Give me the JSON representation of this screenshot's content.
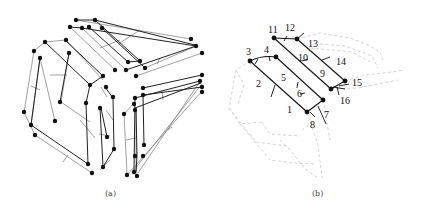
{
  "figure": {
    "panels": [
      {
        "id": "a",
        "caption": "(a)",
        "description": "Three-dimensional wireframe graph with nodes (black dots) arranged as three folded ladder/strip structures forming a cube-like corner view"
      },
      {
        "id": "b",
        "caption": "(b)",
        "description": "Highlighted sub-structure with two parallel solid strips and numbered edges 1-16; remaining structure dashed grey"
      }
    ],
    "panel_b_labels": [
      {
        "text": "1",
        "x": 287,
        "y": 113
      },
      {
        "text": "2",
        "x": 258,
        "y": 87
      },
      {
        "text": "3",
        "x": 248,
        "y": 54
      },
      {
        "text": "4",
        "x": 265,
        "y": 54
      },
      {
        "text": "5",
        "x": 282,
        "y": 80
      },
      {
        "text": "6",
        "x": 298,
        "y": 97
      },
      {
        "text": "7",
        "x": 325,
        "y": 116
      },
      {
        "text": "8",
        "x": 311,
        "y": 128
      },
      {
        "text": "9",
        "x": 320,
        "y": 76
      },
      {
        "text": "10",
        "x": 300,
        "y": 58
      },
      {
        "text": "11",
        "x": 268,
        "y": 32
      },
      {
        "text": "12",
        "x": 285,
        "y": 30
      },
      {
        "text": "13",
        "x": 309,
        "y": 47
      },
      {
        "text": "14",
        "x": 338,
        "y": 64
      },
      {
        "text": "15",
        "x": 352,
        "y": 85
      },
      {
        "text": "16",
        "x": 341,
        "y": 104
      }
    ],
    "colors": {
      "node": "#111111",
      "edge_dark": "#222222",
      "edge_light": "#777777",
      "dashed": "#c8c8c8"
    }
  }
}
